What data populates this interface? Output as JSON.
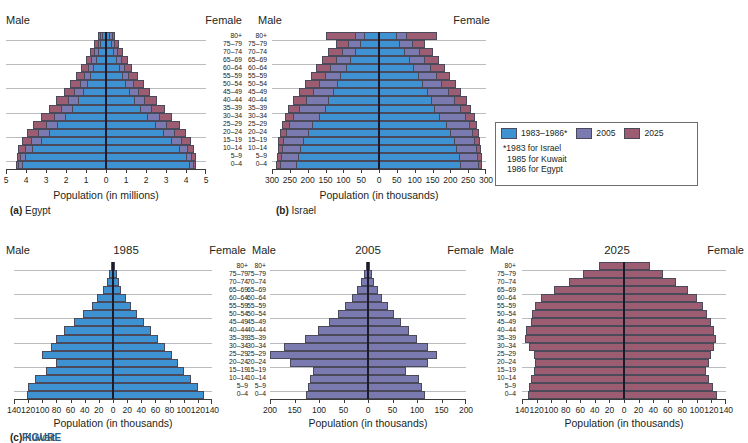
{
  "legend": {
    "items": [
      {
        "label": "1983–1986*",
        "color": "#3f92d2"
      },
      {
        "label": "2005",
        "color": "#7b7ab0"
      },
      {
        "label": "2025",
        "color": "#9c5c72"
      }
    ],
    "notes": [
      "*1983 for Israel",
      "1985 for Kuwait",
      "1986 for Egypt"
    ]
  },
  "figure_label": "FIGURE",
  "labels": {
    "male": "Male",
    "female": "Female",
    "age_groups": [
      "80+",
      "75–79",
      "70–74",
      "65–69",
      "60–64",
      "55–59",
      "50–54",
      "45–49",
      "40–44",
      "35–39",
      "30–34",
      "25–29",
      "20–24",
      "15–19",
      "10–14",
      "5–9",
      "0–4"
    ]
  },
  "chart_data": [
    {
      "id": "egypt",
      "type": "bar",
      "orientation": "population-pyramid",
      "title": "(a) Egypt",
      "caption_prefix": "(a)",
      "caption_text": "Egypt",
      "xlabel": "Population (in millions)",
      "ylabel": "",
      "year_label": "",
      "left_header": "Male",
      "right_header": "Female",
      "xticks": [
        "5",
        "4",
        "3",
        "2",
        "1",
        "0",
        "1",
        "2",
        "3",
        "4",
        "5"
      ],
      "xtick_values": [
        -5,
        -4,
        -3,
        -2,
        -1,
        0,
        1,
        2,
        3,
        4,
        5
      ],
      "xlim": [
        -5,
        5
      ],
      "grid": true,
      "categories": [
        "80+",
        "75–79",
        "70–74",
        "65–69",
        "60–64",
        "55–59",
        "50–54",
        "45–49",
        "40–44",
        "35–39",
        "30–34",
        "25–29",
        "20–24",
        "15–19",
        "10–14",
        "5–9",
        "0–4"
      ],
      "series": [
        {
          "name": "1986",
          "color": "#3f92d2",
          "male": [
            0.2,
            0.28,
            0.4,
            0.52,
            0.66,
            0.8,
            0.95,
            1.15,
            1.4,
            1.7,
            2.05,
            2.45,
            2.85,
            3.25,
            3.7,
            4.05,
            4.2
          ],
          "female": [
            0.22,
            0.3,
            0.42,
            0.55,
            0.68,
            0.84,
            1.0,
            1.2,
            1.46,
            1.76,
            2.12,
            2.52,
            2.92,
            3.32,
            3.72,
            4.05,
            4.22
          ]
        },
        {
          "name": "2005",
          "color": "#7b7ab0",
          "male": [
            0.3,
            0.42,
            0.58,
            0.74,
            0.92,
            1.1,
            1.32,
            1.58,
            1.9,
            2.24,
            2.62,
            3.0,
            3.38,
            3.75,
            4.05,
            4.28,
            4.38
          ],
          "female": [
            0.33,
            0.45,
            0.6,
            0.78,
            0.96,
            1.15,
            1.38,
            1.64,
            1.96,
            2.3,
            2.68,
            3.06,
            3.44,
            3.8,
            4.08,
            4.3,
            4.4
          ]
        },
        {
          "name": "2025",
          "color": "#9c5c72",
          "male": [
            0.42,
            0.6,
            0.8,
            1.02,
            1.26,
            1.52,
            1.8,
            2.12,
            2.48,
            2.86,
            3.26,
            3.64,
            3.96,
            4.22,
            4.38,
            4.46,
            4.48
          ],
          "female": [
            0.46,
            0.64,
            0.85,
            1.08,
            1.32,
            1.58,
            1.88,
            2.2,
            2.56,
            2.94,
            3.32,
            3.7,
            4.0,
            4.26,
            4.4,
            4.48,
            4.5
          ]
        }
      ]
    },
    {
      "id": "israel",
      "type": "bar",
      "orientation": "population-pyramid",
      "title": "(b) Israel",
      "caption_prefix": "(b)",
      "caption_text": "Israel",
      "xlabel": "Population (in thousands)",
      "ylabel": "",
      "year_label": "",
      "left_header": "Male",
      "right_header": "Female",
      "xticks": [
        "300",
        "250",
        "200",
        "150",
        "100",
        "50",
        "0",
        "50",
        "100",
        "150",
        "200",
        "250",
        "300"
      ],
      "xtick_values": [
        -300,
        -250,
        -200,
        -150,
        -100,
        -50,
        0,
        50,
        100,
        150,
        200,
        250,
        300
      ],
      "xlim": [
        -300,
        300
      ],
      "grid": true,
      "categories": [
        "80+",
        "75–79",
        "70–74",
        "65–69",
        "60–64",
        "55–59",
        "50–54",
        "45–49",
        "40–44",
        "35–39",
        "30–34",
        "25–29",
        "20–24",
        "15–19",
        "10–14",
        "5–9",
        "0–4"
      ],
      "series": [
        {
          "name": "1983",
          "color": "#3f92d2",
          "male": [
            42,
            52,
            66,
            80,
            92,
            108,
            118,
            130,
            142,
            152,
            168,
            188,
            200,
            212,
            222,
            228,
            232
          ],
          "female": [
            50,
            58,
            72,
            86,
            98,
            112,
            124,
            136,
            148,
            158,
            172,
            190,
            202,
            212,
            220,
            226,
            230
          ]
        },
        {
          "name": "2005",
          "color": "#7b7ab0",
          "male": [
            68,
            86,
            104,
            120,
            136,
            152,
            168,
            186,
            206,
            224,
            240,
            252,
            262,
            268,
            272,
            276,
            278
          ],
          "female": [
            78,
            96,
            114,
            130,
            146,
            162,
            178,
            196,
            214,
            230,
            244,
            256,
            264,
            270,
            274,
            277,
            279
          ]
        },
        {
          "name": "2025",
          "color": "#9c5c72",
          "male": [
            150,
            120,
            142,
            160,
            176,
            192,
            208,
            224,
            240,
            254,
            264,
            272,
            278,
            282,
            284,
            286,
            288
          ],
          "female": [
            162,
            130,
            150,
            168,
            184,
            200,
            216,
            230,
            246,
            258,
            268,
            276,
            280,
            284,
            286,
            288,
            290
          ]
        }
      ]
    },
    {
      "id": "kuwait-1985",
      "type": "bar",
      "orientation": "population-pyramid",
      "title": "1985",
      "caption_prefix": "(c)",
      "caption_text": "Kuwait",
      "xlabel": "Population (in thousands)",
      "ylabel": "",
      "year_label": "1985",
      "left_header": "Male",
      "right_header": "Female",
      "xticks": [
        "140",
        "120",
        "100",
        "80",
        "60",
        "40",
        "20",
        "0",
        "20",
        "40",
        "60",
        "80",
        "100",
        "120",
        "140"
      ],
      "xtick_values": [
        -140,
        -120,
        -100,
        -80,
        -60,
        -40,
        -20,
        0,
        20,
        40,
        60,
        80,
        100,
        120,
        140
      ],
      "xlim": [
        -140,
        140
      ],
      "grid": true,
      "categories": [
        "80+",
        "75–79",
        "70–74",
        "65–69",
        "60–64",
        "55–59",
        "50–54",
        "45–49",
        "40–44",
        "35–39",
        "30–34",
        "25–29",
        "20–24",
        "15–19",
        "10–14",
        "5–9",
        "0–4"
      ],
      "series": [
        {
          "name": "1985",
          "color": "#3f92d2",
          "male": [
            3,
            5,
            8,
            14,
            22,
            30,
            42,
            55,
            70,
            80,
            88,
            100,
            80,
            95,
            110,
            120,
            122
          ],
          "female": [
            3,
            5,
            8,
            12,
            18,
            25,
            34,
            44,
            54,
            64,
            74,
            84,
            92,
            100,
            110,
            120,
            128
          ]
        }
      ]
    },
    {
      "id": "kuwait-2005",
      "type": "bar",
      "orientation": "population-pyramid",
      "title": "2005",
      "caption_prefix": "",
      "caption_text": "",
      "xlabel": "Population (in thousands)",
      "ylabel": "",
      "year_label": "2005",
      "left_header": "Male",
      "right_header": "Female",
      "xticks": [
        "200",
        "150",
        "100",
        "50",
        "0",
        "50",
        "100",
        "150",
        "200"
      ],
      "xtick_values": [
        -200,
        -150,
        -100,
        -50,
        0,
        50,
        100,
        150,
        200
      ],
      "xlim": [
        -200,
        200
      ],
      "grid": true,
      "categories": [
        "80+",
        "75–79",
        "70–74",
        "65–69",
        "60–64",
        "55–59",
        "50–54",
        "45–49",
        "40–44",
        "35–39",
        "30–34",
        "25–29",
        "20–24",
        "15–19",
        "10–14",
        "5–9",
        "0–4"
      ],
      "series": [
        {
          "name": "2005",
          "color": "#7b7ab0",
          "male": [
            5,
            8,
            14,
            22,
            32,
            46,
            62,
            80,
            102,
            128,
            172,
            200,
            160,
            112,
            118,
            122,
            126
          ],
          "female": [
            5,
            8,
            13,
            20,
            28,
            40,
            54,
            68,
            84,
            100,
            122,
            140,
            122,
            78,
            104,
            110,
            116
          ]
        }
      ]
    },
    {
      "id": "kuwait-2025",
      "type": "bar",
      "orientation": "population-pyramid",
      "title": "2025",
      "caption_prefix": "",
      "caption_text": "",
      "xlabel": "Population (in thousands)",
      "ylabel": "",
      "year_label": "2025",
      "left_header": "Male",
      "right_header": "Female",
      "xticks": [
        "140",
        "120",
        "100",
        "80",
        "60",
        "40",
        "20",
        "0",
        "20",
        "40",
        "60",
        "80",
        "100",
        "120",
        "140"
      ],
      "xtick_values": [
        -140,
        -120,
        -100,
        -80,
        -60,
        -40,
        -20,
        0,
        20,
        40,
        60,
        80,
        100,
        120,
        140
      ],
      "xlim": [
        -140,
        140
      ],
      "grid": true,
      "categories": [
        "80+",
        "75–79",
        "70–74",
        "65–69",
        "60–64",
        "55–59",
        "50–54",
        "45–49",
        "40–44",
        "35–39",
        "30–34",
        "25–29",
        "20–24",
        "15–19",
        "10–14",
        "5–9",
        "0–4"
      ],
      "series": [
        {
          "name": "2025",
          "color": "#9c5c72",
          "male": [
            34,
            56,
            76,
            96,
            114,
            122,
            126,
            128,
            134,
            136,
            130,
            124,
            122,
            124,
            128,
            130,
            132
          ],
          "female": [
            36,
            54,
            72,
            88,
            100,
            108,
            114,
            120,
            124,
            126,
            124,
            120,
            116,
            112,
            116,
            122,
            128
          ]
        }
      ]
    }
  ]
}
